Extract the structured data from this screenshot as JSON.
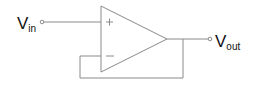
{
  "diagram": {
    "input_label": {
      "main": "V",
      "sub": "in"
    },
    "output_label": {
      "main": "V",
      "sub": "out"
    },
    "non_inverting_symbol": "+",
    "inverting_symbol": "−",
    "colors": {
      "wire": "#8a8a8a",
      "text": "#111111",
      "background": "#ffffff"
    }
  }
}
